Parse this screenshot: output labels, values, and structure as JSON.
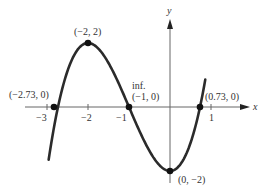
{
  "chart_data": {
    "type": "line",
    "title": "",
    "function": "f(x) = x^3 + 3x^2 - 2",
    "xlabel": "x",
    "ylabel": "y",
    "xlim": [
      -3.5,
      1.9
    ],
    "ylim": [
      -2.4,
      2.7
    ],
    "grid": false,
    "legend": null,
    "x_ticks": [
      {
        "value": -3,
        "label": "−3"
      },
      {
        "value": -2,
        "label": "−2"
      },
      {
        "value": -1,
        "label": "−1"
      },
      {
        "value": 1,
        "label": "1"
      }
    ],
    "series": [
      {
        "name": "curve",
        "x": [
          -2.96,
          -2.73,
          -2.5,
          -2.0,
          -1.5,
          -1.0,
          -0.5,
          0.0,
          0.5,
          0.73,
          0.86
        ],
        "y": [
          -1.22,
          0.0,
          1.125,
          2.0,
          1.375,
          0.0,
          -1.375,
          -2.0,
          -1.125,
          0.0,
          0.86
        ]
      }
    ],
    "points": [
      {
        "x": -2.73,
        "y": 0,
        "label": "(−2.73, 0)"
      },
      {
        "x": -2,
        "y": 2,
        "label": "(−2, 2)"
      },
      {
        "x": -1,
        "y": 0,
        "label": "(−1, 0)",
        "annotation": "inf."
      },
      {
        "x": 0.73,
        "y": 0,
        "label": "(0.73, 0)"
      },
      {
        "x": 0,
        "y": -2,
        "label": "(0, −2)"
      }
    ]
  },
  "labels": {
    "x_axis": "x",
    "y_axis": "y",
    "tick_m3": "−3",
    "tick_m2": "−2",
    "tick_m1": "−1",
    "tick_1": "1",
    "pt_root_left": "(−2.73, 0)",
    "pt_max": "(−2, 2)",
    "pt_inflection_note": "inf.",
    "pt_inflection": "(−1, 0)",
    "pt_root_right": "(0.73, 0)",
    "pt_min": "(0, −2)"
  },
  "colors": {
    "curve": "#2b2b2b",
    "axis": "#555555",
    "text": "#333333"
  }
}
